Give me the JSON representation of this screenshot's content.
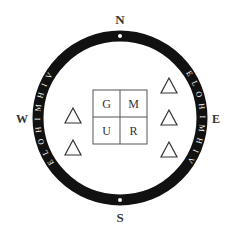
{
  "compass": {
    "north": "N",
    "south": "S",
    "east": "E",
    "west": "W"
  },
  "ring": {
    "right_half_text": "E L O H I M H I V",
    "left_half_text": "E L O H I M H I V",
    "color": "#111111",
    "text_color": "#ffffff"
  },
  "grid": {
    "cells": [
      "G",
      "M",
      "U",
      "R"
    ]
  },
  "triangles": {
    "left_count": 2,
    "right_count": 3
  }
}
